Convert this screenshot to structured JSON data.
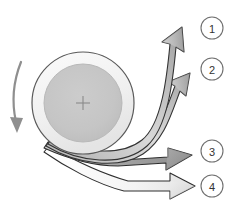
{
  "diagram": {
    "background_color": "#ffffff",
    "rotation_indicator": {
      "icon_name": "rotation-arrow-icon",
      "direction": "counterclockwise",
      "color": "#8a8a8a"
    },
    "drum": {
      "name": "rotating-drum",
      "center_marker": "crosshair",
      "outer_ring_color": "#f2f2f2",
      "outer_ring_stroke": "#555555",
      "inner_disk_color": "#c6c6c6",
      "inner_disk_stroke": "#bcbcbc",
      "crosshair_color": "#8a8a8a"
    },
    "streams": [
      {
        "id": "stream-1",
        "label": "1",
        "fill_light": "#f0f0f0",
        "fill_mid": "#bdbdbd",
        "fill_dark": "#9a9a9a",
        "stroke": "#333333",
        "callout_cx": 212,
        "callout_cy": 28
      },
      {
        "id": "stream-2",
        "label": "2",
        "fill_light": "#efefef",
        "fill_mid": "#bcbcbc",
        "fill_dark": "#9d9d9d",
        "stroke": "#333333",
        "callout_cx": 212,
        "callout_cy": 69
      },
      {
        "id": "stream-3",
        "label": "3",
        "fill_light": "#d8d8d8",
        "fill_mid": "#a8a8a8",
        "fill_dark": "#8c8c8c",
        "stroke": "#2e2e2e",
        "callout_cx": 212,
        "callout_cy": 151
      },
      {
        "id": "stream-4",
        "label": "4",
        "fill_light": "#ffffff",
        "fill_mid": "#e2e2e2",
        "fill_dark": "#c9c9c9",
        "stroke": "#2e2e2e",
        "callout_cx": 212,
        "callout_cy": 186
      }
    ],
    "callout": {
      "radius": 11,
      "fill": "#ffffff",
      "stroke": "#6f6f6f",
      "text_color": "#333333"
    }
  }
}
